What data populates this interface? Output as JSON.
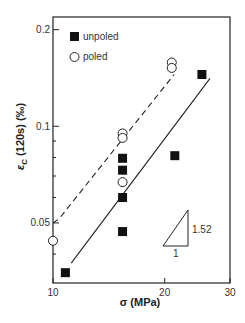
{
  "chart_data": {
    "type": "scatter",
    "title": "",
    "xlabel": "σ (MPa)",
    "ylabel_main": "ε",
    "ylabel_sub": "C",
    "ylabel_rest": " (120s) (‰)",
    "xscale": "log",
    "yscale": "log",
    "xlim": [
      10,
      30
    ],
    "ylim": [
      0.0325,
      0.219
    ],
    "x_ticks": [
      {
        "value": 10,
        "label": "10"
      },
      {
        "value": 20,
        "label": "20"
      },
      {
        "value": 30,
        "label": "30"
      }
    ],
    "y_ticks": [
      {
        "value": 0.05,
        "label": "0.05"
      },
      {
        "value": 0.1,
        "label": "0.1"
      },
      {
        "value": 0.2,
        "label": "0.2"
      }
    ],
    "y_minor_ticks": [
      0.04,
      0.06,
      0.07,
      0.08,
      0.09
    ],
    "grid": false,
    "legend_position": "upper left",
    "series": [
      {
        "name": "unpoled",
        "marker": "filled-square",
        "points": [
          {
            "x": 10.8,
            "y": 0.035
          },
          {
            "x": 15.4,
            "y": 0.0795
          },
          {
            "x": 15.4,
            "y": 0.073
          },
          {
            "x": 15.4,
            "y": 0.06
          },
          {
            "x": 15.4,
            "y": 0.047
          },
          {
            "x": 21.3,
            "y": 0.081
          },
          {
            "x": 25.2,
            "y": 0.145
          }
        ],
        "fit_line": {
          "style": "solid",
          "from": {
            "x": 11.2,
            "y": 0.0375
          },
          "to": {
            "x": 26.5,
            "y": 0.141
          }
        }
      },
      {
        "name": "poled",
        "marker": "open-circle",
        "points": [
          {
            "x": 10.0,
            "y": 0.044
          },
          {
            "x": 15.4,
            "y": 0.095
          },
          {
            "x": 15.4,
            "y": 0.092
          },
          {
            "x": 15.4,
            "y": 0.067
          },
          {
            "x": 20.9,
            "y": 0.158
          },
          {
            "x": 20.9,
            "y": 0.152
          }
        ],
        "fit_line": {
          "style": "dashed",
          "from": {
            "x": 10.0,
            "y": 0.05
          },
          "to": {
            "x": 21.2,
            "y": 0.145
          }
        }
      }
    ],
    "annotations": [
      {
        "type": "slope-triangle",
        "slope_label": "1.52",
        "run_label": "1"
      }
    ]
  },
  "legend": {
    "items": [
      {
        "label": "unpoled",
        "marker": "filled-square"
      },
      {
        "label": "poled",
        "marker": "open-circle"
      }
    ]
  }
}
